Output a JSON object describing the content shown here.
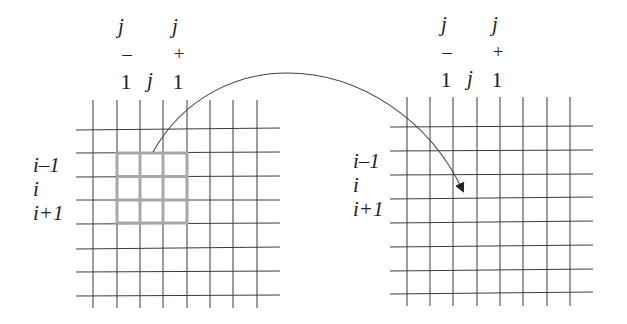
{
  "diagram": {
    "colors": {
      "grid_line": "#3a3a3a",
      "highlight": "#a8a8a8",
      "arrow": "#444444",
      "text": "#222222"
    },
    "left_grid": {
      "column_labels": {
        "j_minus_1": {
          "top": "j",
          "mid": "–",
          "bottom": "1"
        },
        "j": "j",
        "j_plus_1": {
          "top": "j",
          "mid": "+",
          "bottom": "1"
        }
      },
      "row_labels": [
        "i–1",
        "i",
        "i+1"
      ],
      "highlight": "3x3 neighborhood"
    },
    "right_grid": {
      "column_labels": {
        "j_minus_1": {
          "top": "j",
          "mid": "–",
          "bottom": "1"
        },
        "j": "j",
        "j_plus_1": {
          "top": "j",
          "mid": "+",
          "bottom": "1"
        }
      },
      "row_labels": [
        "i–1",
        "i",
        "i+1"
      ]
    },
    "arrow": "curved-arrow from left neighborhood to right cell (i, j)"
  }
}
